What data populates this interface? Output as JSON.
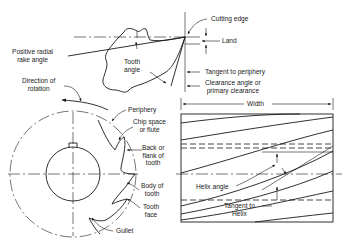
{
  "figure": {
    "tooth_detail": {
      "labels": {
        "cutting_edge": "Cutting edge",
        "land": "Land",
        "positive_radial_rake_angle_1": "Positive radial",
        "positive_radial_rake_angle_2": "rake angle",
        "tooth_angle_1": "Tooth",
        "tooth_angle_2": "angle",
        "tangent_to_periphery": "Tangent to periphery",
        "clearance_angle_1": "Clearance angle or",
        "clearance_angle_2": "primary clearance"
      }
    },
    "end_view": {
      "labels": {
        "direction_of_rotation_1": "Direction of",
        "direction_of_rotation_2": "rotation",
        "periphery": "Periphery",
        "chip_space_1": "Chip space",
        "chip_space_2": "or flute",
        "back_flank_1": "Back or",
        "back_flank_2": "flank of",
        "back_flank_3": "tooth",
        "body_of_tooth_1": "Body of",
        "body_of_tooth_2": "tooth",
        "tooth_face_1": "Tooth",
        "tooth_face_2": "face",
        "gullet": "Gullet"
      }
    },
    "side_view": {
      "labels": {
        "width": "Width",
        "helix_angle": "Helix angle",
        "tangent_to_helix_1": "Tangent to",
        "tangent_to_helix_2": "Helix"
      }
    }
  }
}
